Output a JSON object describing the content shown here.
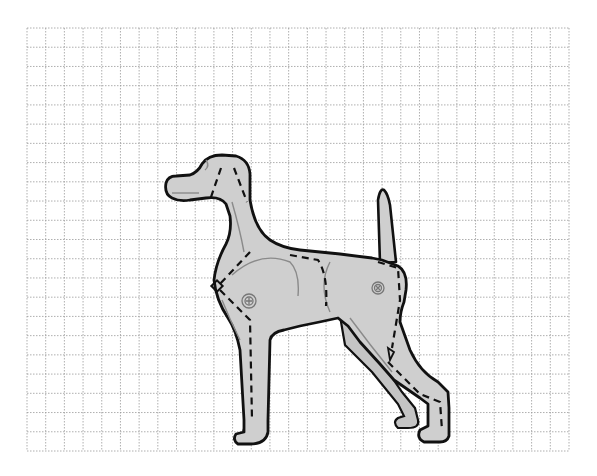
{
  "figure": {
    "title": "Dog pattern on grid",
    "colors": {
      "background": "#ffffff",
      "grid_line": "#9a9a9a",
      "body_fill": "#cfcfcf",
      "outline": "#111111",
      "seam_dash": "#111111",
      "detail_line": "#8a8a8a"
    },
    "grid": {
      "x0": 27,
      "y0": 28,
      "x1": 569,
      "y1": 451,
      "columns": 29,
      "rows": 22,
      "line_style": "dotted"
    },
    "markers": [
      {
        "name": "shoulder-joint",
        "type": "circle-plus",
        "x": 249,
        "y": 301
      },
      {
        "name": "hip-joint",
        "type": "circle-x",
        "x": 378,
        "y": 288
      },
      {
        "name": "chest-diamond",
        "type": "diamond",
        "x": 218,
        "y": 287
      }
    ],
    "seam_lines": [
      "head-left",
      "head-right",
      "neck-chest",
      "front-leg",
      "back",
      "rear-thigh",
      "rear-leg"
    ]
  }
}
